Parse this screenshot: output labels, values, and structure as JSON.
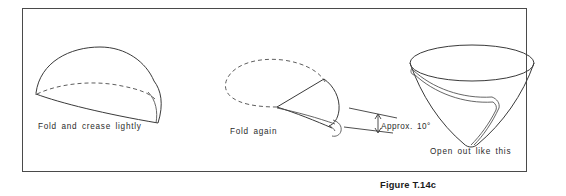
{
  "figure": {
    "number_label": "Figure T.14c",
    "border_color": "#4a4a4a",
    "background_color": "#ffffff",
    "line_color": "#3a3a3a",
    "text_color": "#2b2b2b"
  },
  "stages": [
    {
      "id": "fold-and-crease",
      "caption": "Fold and crease lightly",
      "order": 1,
      "description": "Semicircular folded paper shown in perspective with dashed fold line"
    },
    {
      "id": "fold-again",
      "caption": "Fold again",
      "order": 2,
      "description": "Quarter wedge with dashed outline of previous half circle"
    },
    {
      "id": "open-out",
      "caption": "Open out like this",
      "order": 3,
      "description": "Opened paper cone seen from above"
    }
  ],
  "annotations": {
    "angle": {
      "label": "Approx. 10°",
      "value": 10,
      "unit": "degrees",
      "qualifier": "Approx."
    }
  }
}
